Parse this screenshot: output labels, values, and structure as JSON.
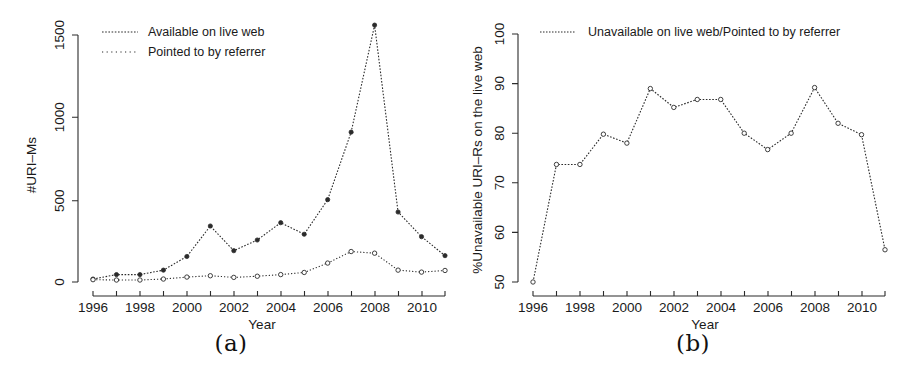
{
  "figure": {
    "panels": [
      {
        "caption": "(a)",
        "xlabel": "Year",
        "ylabel": "#URI–Ms",
        "xticks": [
          "1996",
          "1998",
          "2000",
          "2002",
          "2004",
          "2006",
          "2008",
          "2010"
        ],
        "yticks": [
          "0",
          "500",
          "1000",
          "1500"
        ],
        "legend": [
          "Available on live web",
          "Pointed to by referrer"
        ]
      },
      {
        "caption": "(b)",
        "xlabel": "Year",
        "ylabel": "%Unavailable URI–Rs on the live web",
        "xticks": [
          "1996",
          "1998",
          "2000",
          "2002",
          "2004",
          "2006",
          "2008",
          "2010"
        ],
        "yticks": [
          "50",
          "60",
          "70",
          "80",
          "90",
          "100"
        ],
        "legend": [
          "Unavailable on live web/Pointed to by referrer"
        ]
      }
    ]
  },
  "chart_data": [
    {
      "type": "line",
      "title": "",
      "panel": "(a)",
      "xlabel": "Year",
      "ylabel": "#URI-Ms",
      "x": [
        1996,
        1997,
        1998,
        1999,
        2000,
        2001,
        2002,
        2003,
        2004,
        2005,
        2006,
        2007,
        2008,
        2009,
        2010,
        2011
      ],
      "xlim": [
        1996,
        2011
      ],
      "ylim": [
        0,
        1560
      ],
      "yticks": [
        0,
        500,
        1000,
        1500
      ],
      "xticks": [
        1996,
        1998,
        2000,
        2002,
        2004,
        2006,
        2008,
        2010
      ],
      "grid": false,
      "legend_position": "top-left",
      "series": [
        {
          "name": "Available on live web",
          "style": "dotted-fine-with-filled-circles",
          "values": [
            18,
            45,
            45,
            72,
            155,
            340,
            190,
            255,
            360,
            290,
            500,
            910,
            1560,
            425,
            275,
            160
          ]
        },
        {
          "name": "Pointed to by referrer",
          "style": "dotted-wide-with-open-circles",
          "values": [
            14,
            12,
            12,
            18,
            30,
            38,
            28,
            35,
            45,
            58,
            115,
            185,
            175,
            72,
            60,
            70
          ]
        }
      ]
    },
    {
      "type": "line",
      "title": "",
      "panel": "(b)",
      "xlabel": "Year",
      "ylabel": "%Unavailable URI-Rs on the live web",
      "x": [
        1996,
        1997,
        1998,
        1999,
        2000,
        2001,
        2002,
        2003,
        2004,
        2005,
        2006,
        2007,
        2008,
        2009,
        2010,
        2011
      ],
      "xlim": [
        1996,
        2011
      ],
      "ylim": [
        50,
        100
      ],
      "yticks": [
        50,
        60,
        70,
        80,
        90,
        100
      ],
      "xticks": [
        1996,
        1998,
        2000,
        2002,
        2004,
        2006,
        2008,
        2010
      ],
      "grid": false,
      "legend_position": "top-left",
      "series": [
        {
          "name": "Unavailable on live web/Pointed to by referrer",
          "style": "dotted-with-open-circles",
          "values": [
            50.0,
            73.7,
            73.7,
            79.8,
            78.0,
            89.0,
            85.2,
            86.8,
            86.8,
            80.0,
            76.7,
            80.0,
            89.2,
            82.0,
            79.7,
            56.5
          ]
        }
      ]
    }
  ]
}
